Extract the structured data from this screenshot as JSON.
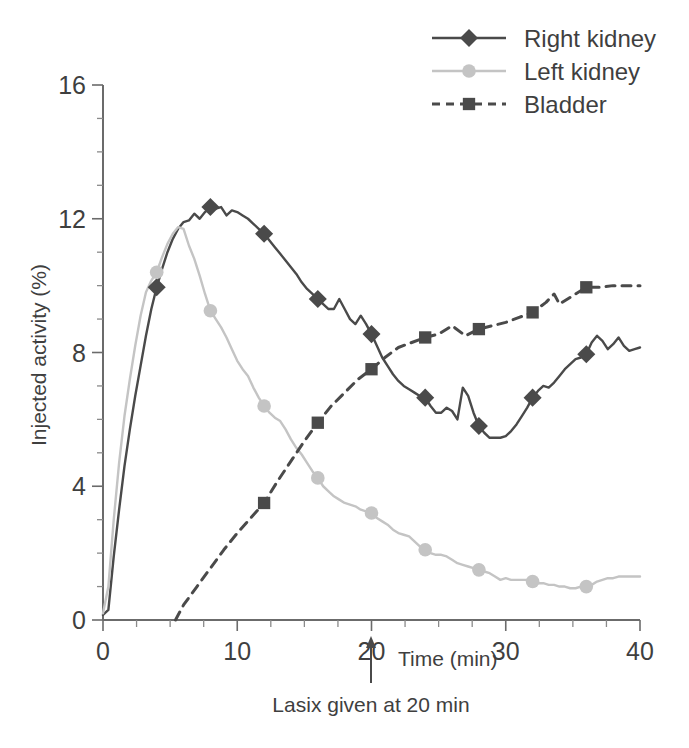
{
  "chart_data": {
    "type": "line",
    "title": "",
    "xlabel": "Time (min)",
    "ylabel": "Injected activity (%)",
    "xlim": [
      0,
      40
    ],
    "ylim": [
      0,
      16
    ],
    "xticks": [
      0,
      10,
      20,
      30,
      40
    ],
    "yticks": [
      0,
      4,
      8,
      12,
      16
    ],
    "xtick_labels": [
      "0",
      "10",
      "20",
      "30",
      "40"
    ],
    "ytick_labels": [
      "0",
      "4",
      "8",
      "12",
      "16"
    ],
    "x_minor_step": 2.5,
    "y_minor_step": 1,
    "grid": false,
    "legend_position": "top-right",
    "annotations": [
      {
        "name": "lasix-annotation",
        "text": "Lasix given at 20 min",
        "x": 20,
        "y": 0,
        "arrow": "up"
      }
    ],
    "series": [
      {
        "name": "Right kidney",
        "color": "#4a4a4a",
        "marker": "diamond",
        "linestyle": "solid",
        "marker_x": [
          4,
          8,
          12,
          16,
          20,
          24,
          28,
          32,
          36
        ],
        "marker_y": [
          9.95,
          12.35,
          11.55,
          9.6,
          8.55,
          6.65,
          5.8,
          6.65,
          7.95
        ],
        "x": [
          0,
          0.4,
          0.8,
          1.2,
          1.6,
          2,
          2.4,
          2.8,
          3.2,
          3.6,
          4,
          4.4,
          4.8,
          5.2,
          5.6,
          6,
          6.4,
          6.8,
          7.2,
          7.6,
          8,
          8.4,
          8.8,
          9.2,
          9.6,
          10,
          10.4,
          10.8,
          11.2,
          11.6,
          12,
          12.4,
          12.8,
          13.2,
          13.6,
          14,
          14.4,
          14.8,
          15.2,
          15.6,
          16,
          16.4,
          16.8,
          17.2,
          17.6,
          18,
          18.4,
          18.8,
          19.2,
          19.6,
          20,
          20.4,
          20.8,
          21.2,
          21.6,
          22,
          22.4,
          22.8,
          23.2,
          23.6,
          24,
          24.4,
          24.8,
          25.2,
          25.6,
          26,
          26.4,
          26.8,
          27.2,
          27.6,
          28,
          28.4,
          28.8,
          29.2,
          29.6,
          30,
          30.4,
          30.8,
          31.2,
          31.6,
          32,
          32.4,
          32.8,
          33.2,
          33.6,
          34,
          34.4,
          34.8,
          35.2,
          35.6,
          36,
          36.4,
          36.8,
          37.2,
          37.6,
          38,
          38.4,
          38.8,
          39.2,
          39.6,
          40
        ],
        "y": [
          0.15,
          0.3,
          1.9,
          3.3,
          4.6,
          5.7,
          6.7,
          7.6,
          8.5,
          9.3,
          9.95,
          10.5,
          11.0,
          11.4,
          11.7,
          11.9,
          11.95,
          12.15,
          12.0,
          12.2,
          12.35,
          12.3,
          12.35,
          12.1,
          12.25,
          12.2,
          12.1,
          12.0,
          11.85,
          11.7,
          11.55,
          11.35,
          11.15,
          10.95,
          10.75,
          10.55,
          10.35,
          10.1,
          9.9,
          9.75,
          9.6,
          9.45,
          9.3,
          9.3,
          9.6,
          9.3,
          9.0,
          8.85,
          9.1,
          8.85,
          8.55,
          8.2,
          7.85,
          7.6,
          7.35,
          7.15,
          7.0,
          6.9,
          6.8,
          6.7,
          6.65,
          6.4,
          6.2,
          6.2,
          6.35,
          6.25,
          6.0,
          6.95,
          6.7,
          6.2,
          5.8,
          5.6,
          5.45,
          5.45,
          5.45,
          5.5,
          5.65,
          5.85,
          6.1,
          6.35,
          6.65,
          6.85,
          7.0,
          6.95,
          7.1,
          7.3,
          7.5,
          7.65,
          7.8,
          7.85,
          7.95,
          8.3,
          8.5,
          8.35,
          8.1,
          8.25,
          8.45,
          8.2,
          8.05,
          8.1,
          8.15
        ]
      },
      {
        "name": "Left kidney",
        "color": "#c4c4c4",
        "marker": "circle",
        "linestyle": "solid",
        "marker_x": [
          4,
          8,
          12,
          16,
          20,
          24,
          28,
          32,
          36
        ],
        "marker_y": [
          10.4,
          9.25,
          6.4,
          4.25,
          3.2,
          2.1,
          1.5,
          1.15,
          1.0
        ],
        "x": [
          0,
          0.4,
          0.8,
          1.2,
          1.6,
          2,
          2.4,
          2.8,
          3.2,
          3.6,
          4,
          4.4,
          4.8,
          5.2,
          5.6,
          6,
          6.4,
          6.8,
          7.2,
          7.6,
          8,
          8.4,
          8.8,
          9.2,
          9.6,
          10,
          10.4,
          10.8,
          11.2,
          11.6,
          12,
          12.4,
          12.8,
          13.2,
          13.6,
          14,
          14.4,
          14.8,
          15.2,
          15.6,
          16,
          16.4,
          16.8,
          17.2,
          17.6,
          18,
          18.4,
          18.8,
          19.2,
          19.6,
          20,
          20.4,
          20.8,
          21.2,
          21.6,
          22,
          22.4,
          22.8,
          23.2,
          23.6,
          24,
          24.4,
          24.8,
          25.2,
          25.6,
          26,
          26.4,
          26.8,
          27.2,
          27.6,
          28,
          28.4,
          28.8,
          29.2,
          29.6,
          30,
          30.4,
          30.8,
          31.2,
          31.6,
          32,
          32.4,
          32.8,
          33.2,
          33.6,
          34,
          34.4,
          34.8,
          35.2,
          35.6,
          36,
          36.4,
          36.8,
          37.2,
          37.6,
          38,
          38.4,
          38.8,
          39.2,
          39.6,
          40
        ],
        "y": [
          0.2,
          1.0,
          3.0,
          4.7,
          6.1,
          7.2,
          8.2,
          9.1,
          9.8,
          10.15,
          10.4,
          10.85,
          11.25,
          11.55,
          11.75,
          11.7,
          11.2,
          10.8,
          10.3,
          9.75,
          9.25,
          9.0,
          8.75,
          8.45,
          8.1,
          7.75,
          7.5,
          7.3,
          6.95,
          6.65,
          6.4,
          6.2,
          6.05,
          5.95,
          5.7,
          5.4,
          5.15,
          4.95,
          4.7,
          4.45,
          4.25,
          4.0,
          3.85,
          3.7,
          3.6,
          3.5,
          3.45,
          3.4,
          3.3,
          3.25,
          3.2,
          3.05,
          2.95,
          2.85,
          2.7,
          2.6,
          2.55,
          2.5,
          2.35,
          2.2,
          2.1,
          2.0,
          1.95,
          1.95,
          1.9,
          1.8,
          1.7,
          1.65,
          1.6,
          1.55,
          1.5,
          1.45,
          1.4,
          1.3,
          1.2,
          1.25,
          1.2,
          1.2,
          1.2,
          1.2,
          1.15,
          1.1,
          1.1,
          1.05,
          1.05,
          1.0,
          1.0,
          0.95,
          0.95,
          1.0,
          1.0,
          1.05,
          1.15,
          1.2,
          1.25,
          1.25,
          1.3,
          1.3,
          1.3,
          1.3,
          1.3
        ]
      },
      {
        "name": "Bladder",
        "color": "#4a4a4a",
        "marker": "square",
        "linestyle": "dashed",
        "marker_x": [
          12,
          16,
          20,
          24,
          28,
          32,
          36
        ],
        "marker_y": [
          3.5,
          5.9,
          7.5,
          8.45,
          8.7,
          9.2,
          9.95
        ],
        "x": [
          5.4,
          6,
          7,
          8,
          9,
          10,
          11,
          12,
          13,
          14,
          15,
          16,
          17,
          18,
          19,
          20,
          21,
          22,
          23,
          24,
          25,
          26,
          27,
          28,
          29,
          30,
          31,
          32,
          33,
          33.6,
          34,
          35,
          36,
          37,
          38,
          39,
          40
        ],
        "y": [
          0.0,
          0.45,
          1.0,
          1.55,
          2.1,
          2.6,
          3.05,
          3.5,
          4.15,
          4.75,
          5.35,
          5.9,
          6.4,
          6.8,
          7.2,
          7.5,
          7.85,
          8.15,
          8.3,
          8.45,
          8.55,
          8.8,
          8.5,
          8.7,
          8.8,
          8.9,
          9.05,
          9.2,
          9.5,
          9.75,
          9.45,
          9.7,
          9.95,
          9.95,
          10.0,
          10.0,
          10.0
        ]
      }
    ]
  },
  "legend": {
    "items": [
      {
        "label": "Right kidney",
        "marker": "diamond",
        "color": "#4a4a4a",
        "linestyle": "solid"
      },
      {
        "label": "Left kidney",
        "marker": "circle",
        "color": "#c4c4c4",
        "linestyle": "solid"
      },
      {
        "label": "Bladder",
        "marker": "square",
        "color": "#4a4a4a",
        "linestyle": "dashed"
      }
    ]
  },
  "axes": {
    "y_title": "Injected activity (%)",
    "x_title": "Time (min)"
  },
  "annotation": {
    "lasix_text": "Lasix given at 20 min"
  }
}
